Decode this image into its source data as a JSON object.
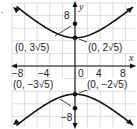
{
  "chart_data": {
    "type": "line",
    "title": "",
    "equation": "y^2/20 - x^2/25 = 1",
    "xlabel": "x",
    "ylabel": "y",
    "xlim": [
      -10,
      10
    ],
    "ylim": [
      -10,
      10
    ],
    "grid": true,
    "grid_step": 2,
    "x_ticks": [
      {
        "value": -8,
        "label": "−8"
      },
      {
        "value": -4,
        "label": "−4"
      },
      {
        "value": 0,
        "label": "0"
      },
      {
        "value": 4,
        "label": "4"
      },
      {
        "value": 8,
        "label": "8"
      }
    ],
    "y_ticks": [
      {
        "value": 8,
        "label": "8"
      },
      {
        "value": -8,
        "label": "−8"
      }
    ],
    "series": [
      {
        "name": "upper branch",
        "a": 4.472,
        "b": 5,
        "direction": "up"
      },
      {
        "name": "lower branch",
        "a": 4.472,
        "b": 5,
        "direction": "down"
      }
    ],
    "points": [
      {
        "name": "upper focus",
        "x": 0,
        "y": 6.708,
        "label": "(0, 3√5)"
      },
      {
        "name": "upper vertex",
        "x": 0,
        "y": 4.472,
        "label": "(0, 2√5)"
      },
      {
        "name": "lower vertex",
        "x": 0,
        "y": -4.472,
        "label": "(0, −2√5)"
      },
      {
        "name": "lower focus",
        "x": 0,
        "y": -6.708,
        "label": "(0, −3√5)"
      }
    ]
  },
  "labels": {
    "part_marker": ".",
    "x_axis": "x",
    "y_axis": "y",
    "tick_x_neg8": "−8",
    "tick_x_neg4": "−4",
    "tick_x_0": "0",
    "tick_x_4": "4",
    "tick_x_8": "8",
    "tick_y_8": "8",
    "tick_y_neg8": "−8",
    "upper_focus": "(0, 3√5)",
    "upper_vertex": "(0, 2√5)",
    "lower_focus": "(0, −3√5)",
    "lower_vertex": "(0, −2√5)"
  },
  "colors": {
    "curve": "#111111",
    "grid": "#cfcfcf",
    "axis": "#111111",
    "text": "#222222"
  }
}
